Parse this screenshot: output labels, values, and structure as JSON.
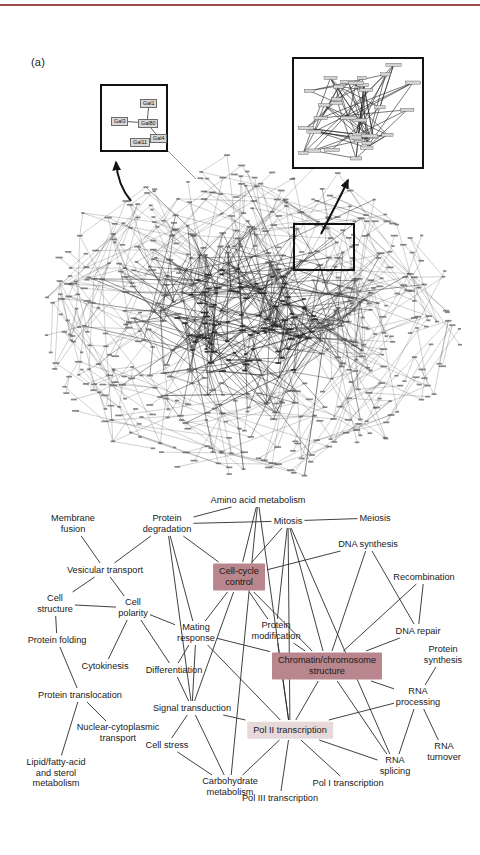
{
  "figure": {
    "panels": [
      {
        "id": "a",
        "label": "(a)"
      },
      {
        "id": "b",
        "label": "(b)"
      }
    ]
  },
  "panel_a": {
    "label": "(a)",
    "description": "Yeast protein-protein interaction network hairball with two magnified insets",
    "inset_left": {
      "name": "galactose-regulon-inset",
      "nodes": [
        {
          "id": "gal1",
          "label": "Gal1",
          "x": 38,
          "y": 13
        },
        {
          "id": "gal3",
          "label": "Gal3",
          "x": 9,
          "y": 31
        },
        {
          "id": "gal80",
          "label": "Gal80",
          "x": 36,
          "y": 33
        },
        {
          "id": "gal4",
          "label": "Gal4",
          "x": 48,
          "y": 48
        },
        {
          "id": "gal11",
          "label": "Gal11",
          "x": 28,
          "y": 52
        }
      ],
      "edges": [
        {
          "from": "gal1",
          "to": "gal80"
        },
        {
          "from": "gal3",
          "to": "gal80"
        },
        {
          "from": "gal80",
          "to": "gal4"
        },
        {
          "from": "gal11",
          "to": "gal4"
        }
      ]
    },
    "inset_right": {
      "name": "network-region-magnified-inset",
      "description": "Magnified view of boxed network region showing labelled gene nodes and interaction edges"
    },
    "roi_box": {
      "name": "region-of-interest-box",
      "description": "Black rectangle marking the magnified region of the network"
    }
  },
  "panel_b": {
    "label": "(b)",
    "description": "Network of functional categories linked by shared protein interactions",
    "colors": {
      "highlight_strong": "#b8868c",
      "highlight_light": "#e7d9da",
      "edge": "#2b2b2b",
      "text": "#1a1a1a"
    },
    "nodes": [
      {
        "id": "membrane_fusion",
        "label": "Membrane\nfusion",
        "x": 73,
        "y": 44,
        "style": "plain"
      },
      {
        "id": "protein_degradation",
        "label": "Protein\ndegradation",
        "x": 167,
        "y": 44,
        "style": "plain"
      },
      {
        "id": "amino_acid",
        "label": "Amino acid metabolism",
        "x": 258,
        "y": 20,
        "style": "plain"
      },
      {
        "id": "mitosis",
        "label": "Mitosis",
        "x": 288,
        "y": 41,
        "style": "plain"
      },
      {
        "id": "meiosis",
        "label": "Meiosis",
        "x": 375,
        "y": 38,
        "style": "plain"
      },
      {
        "id": "dna_synthesis",
        "label": "DNA synthesis",
        "x": 368,
        "y": 64,
        "style": "plain"
      },
      {
        "id": "vesicular_transport",
        "label": "Vesicular transport",
        "x": 105,
        "y": 90,
        "style": "plain"
      },
      {
        "id": "cell_cycle_control",
        "label": "Cell-cycle\ncontrol",
        "x": 239,
        "y": 97,
        "style": "strong"
      },
      {
        "id": "recombination",
        "label": "Recombination",
        "x": 424,
        "y": 97,
        "style": "plain"
      },
      {
        "id": "cell_structure",
        "label": "Cell\nstructure",
        "x": 55,
        "y": 124,
        "style": "plain"
      },
      {
        "id": "cell_polarity",
        "label": "Cell\npolarity",
        "x": 133,
        "y": 128,
        "style": "plain"
      },
      {
        "id": "mating_response",
        "label": "Mating\nresponse",
        "x": 196,
        "y": 153,
        "style": "plain"
      },
      {
        "id": "protein_modification",
        "label": "Protein\nmodification",
        "x": 276,
        "y": 151,
        "style": "plain"
      },
      {
        "id": "dna_repair",
        "label": "DNA repair",
        "x": 418,
        "y": 151,
        "style": "plain"
      },
      {
        "id": "protein_folding",
        "label": "Protein folding",
        "x": 57,
        "y": 160,
        "style": "plain"
      },
      {
        "id": "cytokinesis",
        "label": "Cytokinesis",
        "x": 105,
        "y": 186,
        "style": "plain"
      },
      {
        "id": "differentiation",
        "label": "Differentiation",
        "x": 174,
        "y": 190,
        "style": "plain"
      },
      {
        "id": "chromatin_structure",
        "label": "Chromatin/chromosome\nstructure",
        "x": 327,
        "y": 186,
        "style": "strong"
      },
      {
        "id": "protein_synthesis",
        "label": "Protein\nsynthesis",
        "x": 443,
        "y": 175,
        "style": "plain"
      },
      {
        "id": "protein_translocation",
        "label": "Protein translocation",
        "x": 80,
        "y": 215,
        "style": "plain"
      },
      {
        "id": "signal_transduction",
        "label": "Signal transduction",
        "x": 192,
        "y": 228,
        "style": "plain"
      },
      {
        "id": "rna_processing",
        "label": "RNA\nprocessing",
        "x": 418,
        "y": 217,
        "style": "plain"
      },
      {
        "id": "nuclear_cyto",
        "label": "Nuclear-cytoplasmic\ntransport",
        "x": 118,
        "y": 253,
        "style": "plain"
      },
      {
        "id": "pol2_transcription",
        "label": "Pol II transcription",
        "x": 290,
        "y": 250,
        "style": "light"
      },
      {
        "id": "cell_stress",
        "label": "Cell stress",
        "x": 167,
        "y": 265,
        "style": "plain"
      },
      {
        "id": "rna_turnover",
        "label": "RNA\nturnover",
        "x": 444,
        "y": 272,
        "style": "plain"
      },
      {
        "id": "lipid_sterol",
        "label": "Lipid/fatty-acid\nand sterol\nmetabolism",
        "x": 56,
        "y": 293,
        "style": "plain"
      },
      {
        "id": "rna_splicing",
        "label": "RNA\nsplicing",
        "x": 395,
        "y": 286,
        "style": "plain"
      },
      {
        "id": "carbohydrate",
        "label": "Carbohydrate\nmetabolism",
        "x": 230,
        "y": 307,
        "style": "plain"
      },
      {
        "id": "pol1_transcription",
        "label": "Pol I transcription",
        "x": 348,
        "y": 303,
        "style": "plain"
      },
      {
        "id": "pol3_transcription",
        "label": "Pol III transcription",
        "x": 280,
        "y": 318,
        "style": "plain"
      }
    ],
    "edges": [
      [
        "membrane_fusion",
        "vesicular_transport"
      ],
      [
        "protein_degradation",
        "vesicular_transport"
      ],
      [
        "protein_degradation",
        "amino_acid"
      ],
      [
        "protein_degradation",
        "mitosis"
      ],
      [
        "protein_degradation",
        "cell_cycle_control"
      ],
      [
        "protein_degradation",
        "mating_response"
      ],
      [
        "protein_degradation",
        "signal_transduction"
      ],
      [
        "amino_acid",
        "cell_cycle_control"
      ],
      [
        "amino_acid",
        "carbohydrate"
      ],
      [
        "amino_acid",
        "pol2_transcription"
      ],
      [
        "mitosis",
        "meiosis"
      ],
      [
        "mitosis",
        "cell_cycle_control"
      ],
      [
        "mitosis",
        "protein_modification"
      ],
      [
        "mitosis",
        "chromatin_structure"
      ],
      [
        "mitosis",
        "pol2_transcription"
      ],
      [
        "mitosis",
        "rna_splicing"
      ],
      [
        "dna_synthesis",
        "cell_cycle_control"
      ],
      [
        "dna_synthesis",
        "dna_repair"
      ],
      [
        "dna_synthesis",
        "chromatin_structure"
      ],
      [
        "vesicular_transport",
        "cell_structure"
      ],
      [
        "vesicular_transport",
        "cell_polarity"
      ],
      [
        "cell_cycle_control",
        "mating_response"
      ],
      [
        "cell_cycle_control",
        "protein_modification"
      ],
      [
        "cell_cycle_control",
        "chromatin_structure"
      ],
      [
        "cell_cycle_control",
        "signal_transduction"
      ],
      [
        "recombination",
        "dna_repair"
      ],
      [
        "recombination",
        "chromatin_structure"
      ],
      [
        "cell_structure",
        "cell_polarity"
      ],
      [
        "cell_structure",
        "protein_folding"
      ],
      [
        "cell_polarity",
        "cytokinesis"
      ],
      [
        "cell_polarity",
        "differentiation"
      ],
      [
        "cell_polarity",
        "mating_response"
      ],
      [
        "mating_response",
        "signal_transduction"
      ],
      [
        "mating_response",
        "differentiation"
      ],
      [
        "mating_response",
        "chromatin_structure"
      ],
      [
        "mating_response",
        "pol2_transcription"
      ],
      [
        "protein_modification",
        "chromatin_structure"
      ],
      [
        "protein_modification",
        "pol2_transcription"
      ],
      [
        "dna_repair",
        "chromatin_structure"
      ],
      [
        "protein_folding",
        "protein_translocation"
      ],
      [
        "protein_translocation",
        "nuclear_cyto"
      ],
      [
        "protein_translocation",
        "lipid_sterol"
      ],
      [
        "differentiation",
        "signal_transduction"
      ],
      [
        "chromatin_structure",
        "pol2_transcription"
      ],
      [
        "chromatin_structure",
        "rna_processing"
      ],
      [
        "chromatin_structure",
        "rna_splicing"
      ],
      [
        "protein_synthesis",
        "rna_processing"
      ],
      [
        "signal_transduction",
        "cell_stress"
      ],
      [
        "signal_transduction",
        "carbohydrate"
      ],
      [
        "signal_transduction",
        "pol2_transcription"
      ],
      [
        "rna_processing",
        "rna_turnover"
      ],
      [
        "rna_processing",
        "rna_splicing"
      ],
      [
        "rna_processing",
        "pol2_transcription"
      ],
      [
        "cell_stress",
        "carbohydrate"
      ],
      [
        "pol2_transcription",
        "carbohydrate"
      ],
      [
        "pol2_transcription",
        "pol1_transcription"
      ],
      [
        "pol2_transcription",
        "pol3_transcription"
      ],
      [
        "pol2_transcription",
        "rna_splicing"
      ]
    ]
  }
}
